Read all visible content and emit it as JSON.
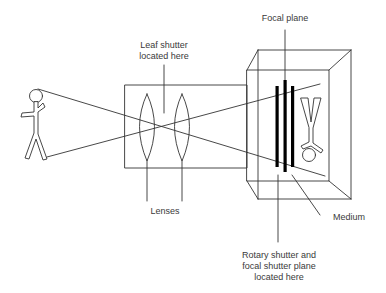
{
  "diagram": {
    "colors": {
      "line": "#333333",
      "bars": "#000000",
      "background": "#ffffff",
      "text": "#3a3a3a"
    },
    "labels": {
      "leaf_shutter": {
        "line1": "Leaf shutter",
        "line2": "located here"
      },
      "focal_plane": "Focal plane",
      "lenses": "Lenses",
      "medium": "Medium",
      "rotary_shutter": {
        "line1": "Rotary shutter and",
        "line2": "focal shutter plane",
        "line3": "located here"
      }
    },
    "components": [
      "subject-figure",
      "lens-tube",
      "lens-1",
      "lens-2",
      "camera-body",
      "focal-plane-bars",
      "inverted-image",
      "light-rays"
    ]
  }
}
